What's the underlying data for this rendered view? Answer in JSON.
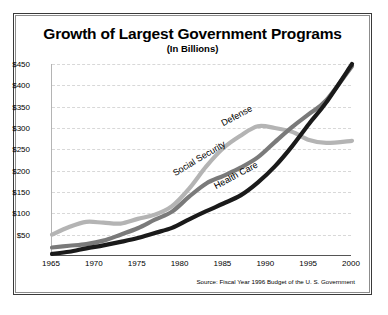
{
  "chart_data": {
    "type": "line",
    "title": "Growth of Largest Government Programs",
    "subtitle": "(In Billions)",
    "xlabel": "",
    "ylabel": "",
    "source": "Source: Fiscal Year 1996 Budget of the U. S. Government",
    "xlim": [
      1965,
      2000
    ],
    "ylim": [
      0,
      450
    ],
    "grid": true,
    "legend_position": "inline-annotations",
    "x_ticks": [
      "1965",
      "1970",
      "1975",
      "1980",
      "1985",
      "1990",
      "1995",
      "2000"
    ],
    "y_ticks": [
      "$50",
      "$100",
      "$150",
      "$200",
      "$250",
      "$300",
      "$350",
      "$400",
      "$450"
    ],
    "x": [
      1965,
      1967,
      1969,
      1971,
      1973,
      1975,
      1977,
      1979,
      1981,
      1983,
      1985,
      1987,
      1989,
      1991,
      1993,
      1995,
      1997,
      2000
    ],
    "series": [
      {
        "name": "Defense",
        "color": "#b4b4b4",
        "values": [
          50,
          68,
          80,
          78,
          76,
          87,
          97,
          117,
          158,
          210,
          253,
          282,
          304,
          300,
          291,
          272,
          265,
          270
        ]
      },
      {
        "name": "Social Security",
        "color": "#7a7a7a",
        "values": [
          20,
          24,
          28,
          36,
          50,
          65,
          85,
          104,
          139,
          170,
          188,
          207,
          231,
          267,
          302,
          333,
          365,
          445
        ]
      },
      {
        "name": "Health Care",
        "color": "#1a1a1a",
        "values": [
          5,
          10,
          18,
          25,
          33,
          42,
          54,
          66,
          86,
          105,
          123,
          142,
          172,
          210,
          257,
          310,
          360,
          450
        ]
      }
    ]
  },
  "annotations": [
    {
      "label": "Defense",
      "rotation": -28
    },
    {
      "label": "Social Security",
      "rotation": -31
    },
    {
      "label": "Health Care",
      "rotation": -28
    }
  ]
}
